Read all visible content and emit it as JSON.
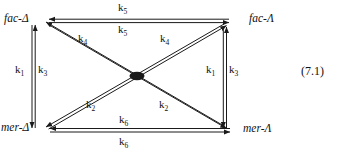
{
  "figure": {
    "type": "reaction-scheme",
    "equation_number": "(7.1)",
    "nodes": [
      {
        "id": "fac-delta",
        "label": "fac-Δ",
        "position": "top-left"
      },
      {
        "id": "fac-lambda",
        "label": "fac-Λ",
        "position": "top-right"
      },
      {
        "id": "mer-delta",
        "label": "mer-Δ",
        "position": "bottom-left"
      },
      {
        "id": "mer-lambda",
        "label": "mer-Λ",
        "position": "bottom-right"
      }
    ],
    "rate_constants": {
      "k1": "k",
      "k1_sub": "1",
      "k2": "k",
      "k2_sub": "2",
      "k3": "k",
      "k3_sub": "3",
      "k4": "k",
      "k4_sub": "4",
      "k5": "k",
      "k5_sub": "5",
      "k6": "k",
      "k6_sub": "6"
    },
    "edges": [
      {
        "id": "top-horizontal",
        "from": "fac-delta",
        "to": "fac-lambda",
        "labels": [
          "k5",
          "k5"
        ],
        "arrows": "both"
      },
      {
        "id": "bottom-horizontal",
        "from": "mer-delta",
        "to": "mer-lambda",
        "labels": [
          "k6",
          "k6"
        ],
        "arrows": "both"
      },
      {
        "id": "left-vertical",
        "from": "mer-delta",
        "to": "fac-delta",
        "labels": [
          "k1",
          "k3"
        ],
        "arrows": "both"
      },
      {
        "id": "right-vertical",
        "from": "fac-lambda",
        "to": "mer-lambda",
        "labels": [
          "k1",
          "k3"
        ],
        "arrows": "both"
      },
      {
        "id": "diagonal-nwse",
        "from": "fac-delta",
        "to": "mer-lambda",
        "labels": [
          "k4",
          "k2"
        ],
        "arrows": "both"
      },
      {
        "id": "diagonal-swne",
        "from": "mer-delta",
        "to": "fac-lambda",
        "labels": [
          "k2",
          "k4"
        ],
        "arrows": "both"
      }
    ],
    "colors": {
      "line": "#1a1a1a",
      "text": "#111111",
      "background": "#ffffff"
    }
  }
}
